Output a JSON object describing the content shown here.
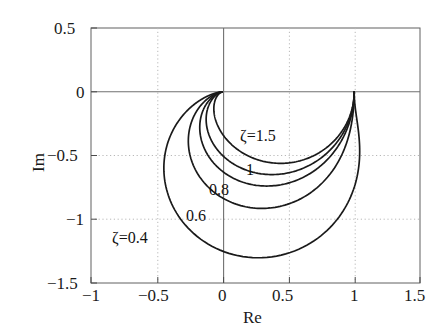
{
  "chart_data": {
    "type": "line",
    "title": "",
    "xlabel": "Re",
    "ylabel": "Im",
    "xlim": [
      -1,
      1.5
    ],
    "ylim": [
      -1.5,
      0.5
    ],
    "xticks": [
      -1,
      -0.5,
      0,
      0.5,
      1,
      1.5
    ],
    "yticks": [
      0.5,
      0,
      -0.5,
      -1,
      -1.5
    ],
    "xtick_labels": [
      "−1",
      "−0.5",
      "0",
      "0.5",
      "1",
      "1.5"
    ],
    "ytick_labels": [
      "0.5",
      "0",
      "−0.5",
      "−1",
      "−1.5"
    ],
    "grid": true,
    "grid_style": "dotted",
    "zero_axes": true,
    "legend_position": "inline-annotations",
    "line_color": "#1a1a1a",
    "series": [
      {
        "name": "ζ=0.4",
        "zeta": 0.4,
        "label": "ζ=0.4",
        "label_x": -0.55,
        "label_y": -1.12,
        "min_im": -1.28,
        "min_im_at_re": 0.28,
        "min_re": -0.43,
        "points": [
          [
            1.0,
            0.0
          ],
          [
            0.996,
            -0.079
          ],
          [
            0.982,
            -0.161
          ],
          [
            0.953,
            -0.248
          ],
          [
            0.905,
            -0.34
          ],
          [
            0.832,
            -0.436
          ],
          [
            0.73,
            -0.531
          ],
          [
            0.597,
            -0.617
          ],
          [
            0.437,
            -0.68
          ],
          [
            0.261,
            -0.704
          ],
          [
            0.091,
            -0.679
          ],
          [
            -0.055,
            -0.611
          ],
          [
            -0.166,
            -0.516
          ],
          [
            -0.241,
            -0.412
          ],
          [
            -0.284,
            -0.31
          ],
          [
            -0.302,
            -0.217
          ],
          [
            -0.3,
            -0.134
          ],
          [
            -0.283,
            -0.063
          ],
          [
            -0.255,
            -0.003
          ],
          [
            -0.22,
            0.0
          ],
          [
            -0.3,
            -0.9
          ],
          [
            -0.18,
            -1.11
          ],
          [
            0.01,
            -1.235
          ],
          [
            0.2,
            -1.278
          ],
          [
            0.4,
            -1.25
          ],
          [
            0.6,
            -1.16
          ],
          [
            0.76,
            -1.02
          ],
          [
            0.88,
            -0.85
          ],
          [
            0.96,
            -0.64
          ],
          [
            1.01,
            -0.4
          ],
          [
            1.02,
            -0.19
          ],
          [
            1.0,
            0.0
          ]
        ]
      },
      {
        "name": "0.6",
        "zeta": 0.6,
        "label": "0.6",
        "label_x": -0.04,
        "label_y": -0.95,
        "min_im": -0.94,
        "min_im_at_re": 0.3
      },
      {
        "name": "0.8",
        "zeta": 0.8,
        "label": "0.8",
        "label_x": -0.18,
        "label_y": -0.76,
        "min_im": -0.72,
        "min_im_at_re": 0.34
      },
      {
        "name": "1",
        "zeta": 1.0,
        "label": "1",
        "label_x": 0.3,
        "label_y": -0.6,
        "min_im": -0.63,
        "min_im_at_re": 0.38
      },
      {
        "name": "ζ=1.5",
        "zeta": 1.5,
        "label": "ζ=1.5",
        "label_x": 0.34,
        "label_y": -0.4,
        "min_im": -0.56,
        "min_im_at_re": 0.4
      }
    ]
  },
  "axes": {
    "x_title": "Re",
    "y_title": "Im"
  }
}
